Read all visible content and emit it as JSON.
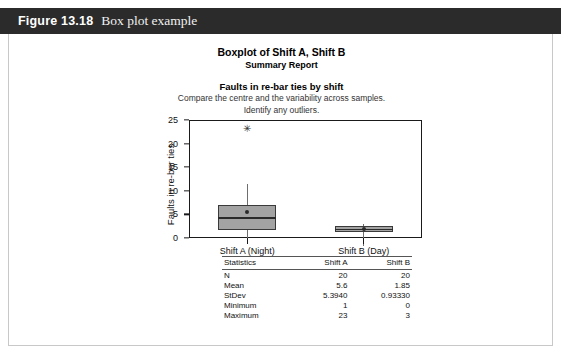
{
  "figure": {
    "number": "Figure 13.18",
    "caption": "Box plot example"
  },
  "report": {
    "title": "Boxplot of Shift A, Shift B",
    "subtitle": "Summary Report",
    "question": "Faults in re-bar ties by shift",
    "description_line1": "Compare the centre and the variability across samples.",
    "description_line2": "Identify any outliers."
  },
  "chart_data": {
    "type": "box",
    "title": "Boxplot of Shift A, Shift B",
    "xlabel": "",
    "ylabel": "Faults in re-bar ties",
    "ylim": [
      0,
      25
    ],
    "yticks": [
      0,
      5,
      10,
      15,
      20,
      25
    ],
    "grid": false,
    "legend": "none",
    "categories": [
      "Shift A (Night)",
      "Shift B (Day)"
    ],
    "boxes": [
      {
        "name": "Shift A (Night)",
        "min": 1,
        "q1": 1.6,
        "median": 4.4,
        "q3": 7.0,
        "whisker_low": 1,
        "whisker_high": 11.5,
        "mean": 5.6,
        "outliers": [
          23
        ]
      },
      {
        "name": "Shift B (Day)",
        "min": 0,
        "q1": 1.3,
        "median": 2.0,
        "q3": 2.5,
        "whisker_low": 0,
        "whisker_high": 3,
        "mean": 1.85,
        "outliers": []
      }
    ]
  },
  "stats_table": {
    "headers": [
      "Statistics",
      "Shift A",
      "Shift B"
    ],
    "rows": [
      {
        "label": "N",
        "shift_a": "20",
        "shift_b": "20"
      },
      {
        "label": "Mean",
        "shift_a": "5.6",
        "shift_b": "1.85"
      },
      {
        "label": "StDev",
        "shift_a": "5.3940",
        "shift_b": "0.93330"
      },
      {
        "label": "Minimum",
        "shift_a": "1",
        "shift_b": "0"
      },
      {
        "label": "Maximum",
        "shift_a": "23",
        "shift_b": "3"
      }
    ]
  },
  "marks": {
    "outlier_glyph": "✳"
  }
}
